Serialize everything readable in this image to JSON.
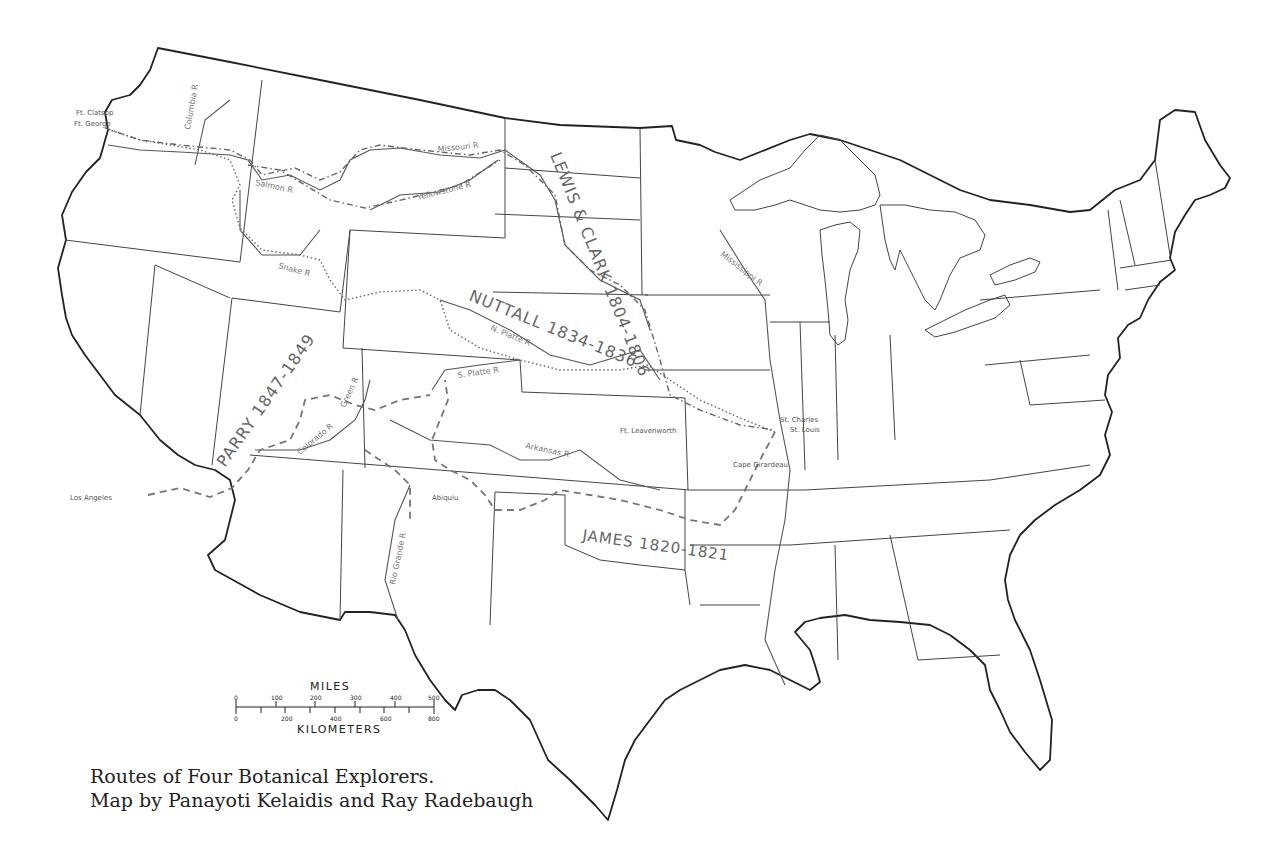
{
  "caption": {
    "line1": "Routes of Four Botanical Explorers.",
    "line2": "Map by Panayoti Kelaidis and Ray Radebaugh"
  },
  "routes": [
    {
      "name": "LEWIS & CLARK",
      "label": "LEWIS & CLARK 1804-1806",
      "years": "1804-1806",
      "style": "dash-dot"
    },
    {
      "name": "NUTTALL",
      "label": "NUTTALL 1834-1836",
      "years": "1834-1836",
      "style": "dotted"
    },
    {
      "name": "PARRY",
      "label": "PARRY 1847-1849",
      "years": "1847-1849",
      "style": "dashed"
    },
    {
      "name": "JAMES",
      "label": "JAMES 1820-1821",
      "years": "1820-1821",
      "style": "dashed"
    }
  ],
  "places": {
    "ft_clatsop": "Ft. Clatsop",
    "ft_george": "Ft. George",
    "los_angeles": "Los Angeles",
    "abiquiu": "Abiquiu",
    "ft_leavenworth": "Ft. Leavenworth",
    "st_charles": "St. Charles",
    "st_louis": "St. Louis",
    "cape_girardeau": "Cape Girardeau"
  },
  "rivers": {
    "columbia": "Columbia R",
    "salmon": "Salmon R",
    "snake": "Snake R",
    "missouri": "Missouri R",
    "yellowstone": "Yellowstone R",
    "n_platte": "N. Platte R",
    "s_platte": "S. Platte R",
    "arkansas": "Arkansas R",
    "green": "Green R",
    "colorado": "Colorado R",
    "rio_grande": "Rio Grande R",
    "mississippi": "Mississippi R"
  },
  "scale": {
    "miles_title": "MILES",
    "km_title": "KILOMETERS",
    "miles_ticks": [
      "0",
      "100",
      "200",
      "300",
      "400",
      "500"
    ],
    "km_ticks": [
      "0",
      "200",
      "400",
      "600",
      "800"
    ]
  }
}
